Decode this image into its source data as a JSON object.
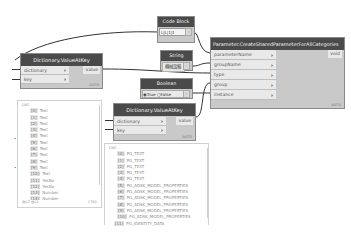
{
  "nodes": {
    "code_block": {
      "title": "Code Block",
      "code": "1;1;1;1",
      "cells": [
        "L",
        "L",
        "1",
        "1"
      ]
    },
    "string": {
      "title": "String",
      "value": "機械設備"
    },
    "boolean": {
      "title": "Boolean",
      "option_true": "True",
      "option_false": "False",
      "selected": "True"
    },
    "dict_value_at_key_1": {
      "title": "Dictionary.ValueAtKey",
      "inputs": [
        "dictionary",
        "key"
      ],
      "output": "value",
      "lacing": "AUTO"
    },
    "dict_value_at_key_2": {
      "title": "Dictionary.ValueAtKey",
      "inputs": [
        "dictionary",
        "key"
      ],
      "output": "value",
      "lacing": "AUTO"
    },
    "create_shared_param": {
      "title": "Parameter.CreateSharedParameterForAllCategories",
      "inputs": [
        "parameterName",
        "groupName",
        "type",
        "group",
        "instance"
      ],
      "output": "void",
      "lacing": "AUTO"
    }
  },
  "previews": {
    "preview_1": {
      "title": "List",
      "items": [
        {
          "idx": "[0]",
          "value": "Text"
        },
        {
          "idx": "[1]",
          "value": "Text"
        },
        {
          "idx": "[2]",
          "value": "Text"
        },
        {
          "idx": "[3]",
          "value": "Text"
        },
        {
          "idx": "[4]",
          "value": "Text"
        },
        {
          "idx": "[5]",
          "value": "Text"
        },
        {
          "idx": "[6]",
          "value": "Text"
        },
        {
          "idx": "[7]",
          "value": "Text"
        },
        {
          "idx": "[8]",
          "value": "Text"
        },
        {
          "idx": "[9]",
          "value": "Text"
        },
        {
          "idx": "[10]",
          "value": "Text"
        },
        {
          "idx": "[11]",
          "value": "YesNo"
        },
        {
          "idx": "[12]",
          "value": "YesNo"
        },
        {
          "idx": "[13]",
          "value": "Number"
        },
        {
          "idx": "[14]",
          "value": "Number"
        }
      ],
      "footer_left": "@L2 @L1",
      "footer_right": "{70}"
    },
    "preview_2": {
      "title": "List",
      "items": [
        {
          "idx": "[0]",
          "value": "PG_TEXT"
        },
        {
          "idx": "[1]",
          "value": "PG_TEXT"
        },
        {
          "idx": "[2]",
          "value": "PG_TEXT"
        },
        {
          "idx": "[3]",
          "value": "PG_TEXT"
        },
        {
          "idx": "[4]",
          "value": "PG_TEXT"
        },
        {
          "idx": "[5]",
          "value": "PG_ADSK_MODEL_PROPERTIES"
        },
        {
          "idx": "[6]",
          "value": "PG_ADSK_MODEL_PROPERTIES"
        },
        {
          "idx": "[7]",
          "value": "PG_ADSK_MODEL_PROPERTIES"
        },
        {
          "idx": "[8]",
          "value": "PG_ADSK_MODEL_PROPERTIES"
        },
        {
          "idx": "[9]",
          "value": "PG_ADSK_MODEL_PROPERTIES"
        },
        {
          "idx": "[10]",
          "value": "PG_ADSK_MODEL_PROPERTIES"
        },
        {
          "idx": "[11]",
          "value": "PG_IDENTITY_DATA"
        }
      ]
    }
  },
  "colors": {
    "header": "#4a4a4a",
    "node_body": "#c9c9c9",
    "port_bg": "#e9e9e9",
    "wire": "#333333"
  }
}
